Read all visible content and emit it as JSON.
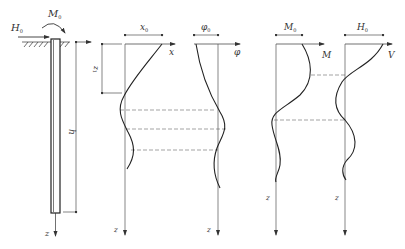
{
  "pile": {
    "load_horizontal": "H",
    "load_horizontal_sub": "0",
    "load_moment": "M",
    "load_moment_sub": "0",
    "length_label": "h",
    "axis_label": "z",
    "z1_label": "z",
    "z1_sub": "1"
  },
  "panels": [
    {
      "id": "deflection",
      "top_label": "x",
      "top_sub": "0",
      "axis_label": "x",
      "depth_label": "z"
    },
    {
      "id": "rotation",
      "top_label": "φ",
      "top_sub": "0",
      "axis_label": "φ",
      "depth_label": "z"
    },
    {
      "id": "moment",
      "top_label": "M",
      "top_sub": "0",
      "axis_label": "M",
      "depth_label": "z"
    },
    {
      "id": "shear",
      "top_label": "H",
      "top_sub": "0",
      "axis_label": "V",
      "depth_label": "z"
    }
  ],
  "colors": {
    "line": "#333333",
    "thin": "#555555",
    "dash": "#666666"
  }
}
